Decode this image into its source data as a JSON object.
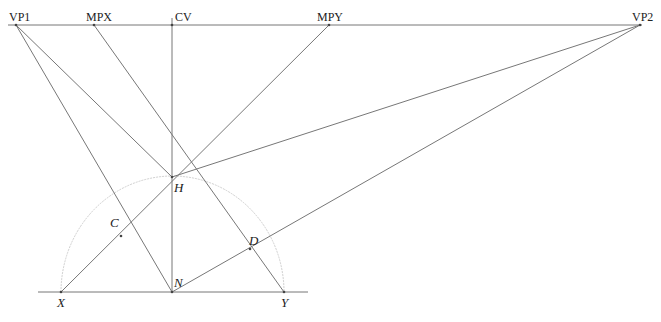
{
  "diagram": {
    "horizon_y": 25,
    "colors": {
      "line": "#777777",
      "arc": "#cfcfcf",
      "text": "#222222"
    },
    "top_labels": {
      "vp1": "VP1",
      "mpx": "MPX",
      "cv": "CV",
      "mpy": "MPY",
      "vp2": "VP2"
    },
    "point_labels": {
      "h": "H",
      "c": "C",
      "d": "D",
      "n": "N",
      "x": "X",
      "y": "Y"
    },
    "points": {
      "VP1": [
        16,
        25
      ],
      "MPX": [
        94,
        25
      ],
      "CV": [
        172,
        25
      ],
      "MPY": [
        329,
        25
      ],
      "VP2": [
        640,
        25
      ],
      "H": [
        172,
        177
      ],
      "C": [
        121,
        236
      ],
      "D": [
        250,
        249
      ],
      "N": [
        172,
        292
      ],
      "X": [
        61,
        292
      ],
      "Y": [
        284,
        292
      ]
    }
  }
}
